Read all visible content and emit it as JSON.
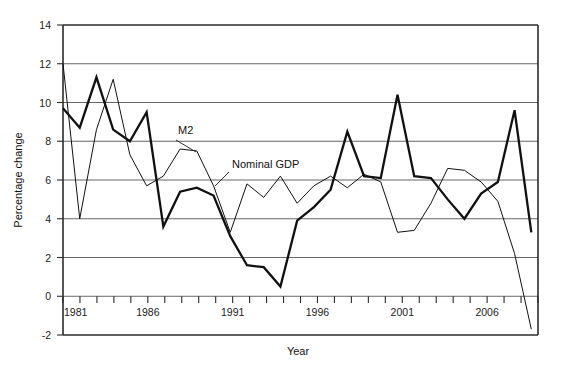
{
  "chart_data": {
    "type": "line",
    "title": "",
    "xlabel": "Year",
    "ylabel": "Percentage change",
    "xlim": [
      1981,
      2009.4
    ],
    "ylim": [
      -2,
      14
    ],
    "yticks": [
      -2,
      0,
      2,
      4,
      6,
      8,
      10,
      12,
      14
    ],
    "ytick_labels": [
      "-2",
      "0",
      "2",
      "4",
      "6",
      "8",
      "10",
      "12",
      "14"
    ],
    "xticks": [
      1981,
      1982,
      1983,
      1984,
      1985,
      1986,
      1987,
      1988,
      1989,
      1990,
      1991,
      1992,
      1993,
      1994,
      1995,
      1996,
      1997,
      1998,
      1999,
      2000,
      2001,
      2002,
      2003,
      2004,
      2005,
      2006,
      2007,
      2008,
      2009
    ],
    "xtick_labels_shown": [
      "1981",
      "1986",
      "1991",
      "1996",
      "2001",
      "2006"
    ],
    "xtick_labels_shown_values": [
      1981,
      1986,
      1991,
      1996,
      2001,
      2006
    ],
    "grid": "horizontal",
    "legend_position": "inline-annotations",
    "x": [
      1981,
      1982,
      1983,
      1984,
      1985,
      1986,
      1987,
      1988,
      1989,
      1990,
      1991,
      1992,
      1993,
      1994,
      1995,
      1996,
      1997,
      1998,
      1999,
      2000,
      2001,
      2002,
      2003,
      2004,
      2005,
      2006,
      2007,
      2008,
      2009
    ],
    "series": [
      {
        "name": "M2",
        "label": "M2",
        "style": "thick",
        "values": [
          9.7,
          8.7,
          11.3,
          8.6,
          8.0,
          9.5,
          3.6,
          5.4,
          5.6,
          5.2,
          3.1,
          1.6,
          1.5,
          0.5,
          3.9,
          4.6,
          5.5,
          8.5,
          6.2,
          6.1,
          10.4,
          6.2,
          6.1,
          5.0,
          4.0,
          5.3,
          5.9,
          9.6,
          3.3
        ]
      },
      {
        "name": "Nominal GDP",
        "label": "Nominal GDP",
        "style": "thin",
        "values": [
          12.0,
          4.0,
          8.6,
          11.2,
          7.3,
          5.7,
          6.2,
          7.6,
          7.5,
          5.7,
          3.3,
          5.8,
          5.1,
          6.2,
          4.8,
          5.7,
          6.2,
          5.6,
          6.3,
          5.9,
          3.3,
          3.4,
          4.8,
          6.6,
          6.5,
          5.9,
          4.9,
          2.2,
          -1.7
        ]
      }
    ],
    "annotations": [
      {
        "text": "M2",
        "x": 1987.2,
        "y": 8.0
      },
      {
        "text": "Nominal GDP",
        "x": 1992.4,
        "y": 6.5
      }
    ]
  },
  "labels": {
    "y_axis_title": "Percentage change",
    "x_axis_title": "Year",
    "m2_label": "M2",
    "gdp_label": "Nominal GDP",
    "y_tick_14": "14",
    "y_tick_12": "12",
    "y_tick_10": "10",
    "y_tick_8": "8",
    "y_tick_6": "6",
    "y_tick_4": "4",
    "y_tick_2": "2",
    "y_tick_0": "0",
    "y_tick_neg2": "-2",
    "x_tick_1981": "1981",
    "x_tick_1986": "1986",
    "x_tick_1991": "1991",
    "x_tick_1996": "1996",
    "x_tick_2001": "2001",
    "x_tick_2006": "2006"
  },
  "colors": {
    "background": "#ffffff",
    "axis": "#2b2b2b",
    "grid": "#555555",
    "line": "#111111",
    "text": "#1a1a1a"
  }
}
